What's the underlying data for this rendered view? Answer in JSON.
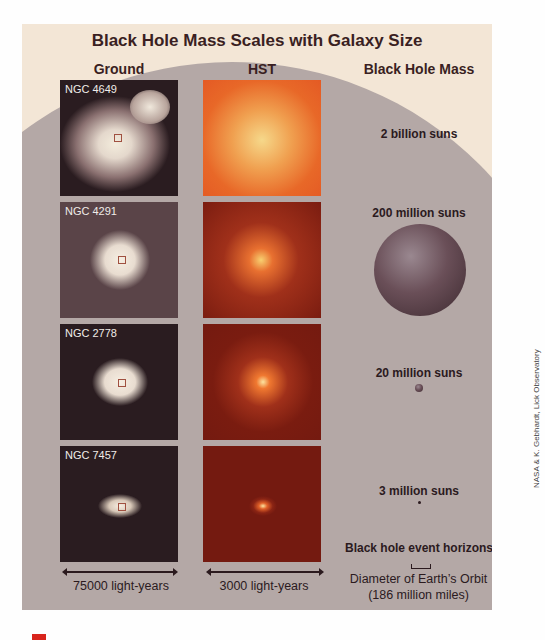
{
  "title": "Black Hole Mass Scales with Galaxy Size",
  "columns": {
    "ground": "Ground",
    "hst": "HST",
    "mass": "Black Hole Mass"
  },
  "galaxies": [
    {
      "name": "NGC 4649",
      "mass": "2 billion suns"
    },
    {
      "name": "NGC 4291",
      "mass": "200 million suns"
    },
    {
      "name": "NGC 2778",
      "mass": "20 million suns"
    },
    {
      "name": "NGC 7457",
      "mass": "3 million suns"
    }
  ],
  "event_horizons_label": "Black hole event horizons",
  "scale_bar": {
    "label1": "Diameter of Earth’s Orbit",
    "label2": "(186 million miles)"
  },
  "ground_scale": "75000 light-years",
  "hst_scale": "3000 light-years",
  "credit": "NASA & K. Gebhardt, Lick Observatory",
  "colors": {
    "background": "#f3e6d6",
    "circle": "#b4a8a6",
    "title": "#3a1f22",
    "hst_bright": "#e8602a",
    "hst_dark": "#7a1c10"
  }
}
